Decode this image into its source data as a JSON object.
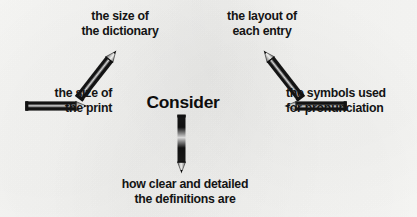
{
  "diagram": {
    "type": "spider-map",
    "title_visible": false,
    "background_color": "#f7f7f5",
    "ink_color": "#121212",
    "center": {
      "label": "Consider"
    },
    "branches": [
      {
        "id": "top-left",
        "direction": "up-left",
        "connector": "pencil-arrow",
        "lines": [
          "the size of",
          "the dictionary"
        ]
      },
      {
        "id": "top-right",
        "direction": "up-right",
        "connector": "pencil-arrow",
        "lines": [
          "the layout of",
          "each entry"
        ]
      },
      {
        "id": "left",
        "direction": "left",
        "connector": "pencil-arrow",
        "lines": [
          "the size of",
          "the print"
        ]
      },
      {
        "id": "right",
        "direction": "right",
        "connector": "pencil-arrow",
        "lines": [
          "the symbols used",
          "for pronunciation"
        ]
      },
      {
        "id": "bottom",
        "direction": "down",
        "connector": "pencil-arrow",
        "lines": [
          "how clear and detailed",
          "the definitions are"
        ]
      }
    ]
  }
}
